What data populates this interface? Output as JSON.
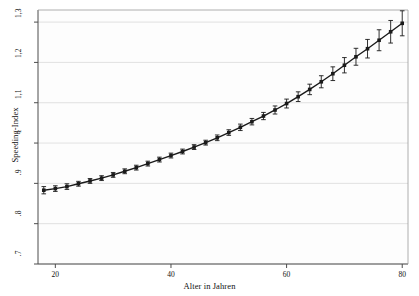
{
  "chart_data": {
    "type": "line",
    "title": "",
    "subtitle": "",
    "xlabel": "Alter in Jahren",
    "ylabel": "Speeding-Index",
    "xlim": [
      17,
      81
    ],
    "ylim": [
      0.7,
      1.33
    ],
    "xticks": [
      20,
      40,
      60,
      80
    ],
    "xticklabels": [
      "20",
      "40",
      "60",
      "80"
    ],
    "yticks": [
      0.7,
      0.8,
      0.9,
      1.0,
      1.1,
      1.2,
      1.3
    ],
    "yticklabels": [
      ".7",
      ".8",
      ".9",
      "1",
      "1,1",
      "1,2",
      "1,3"
    ],
    "grid": "horizontal",
    "legend": "none",
    "marker": "filled-square",
    "errorbars": true,
    "series": [
      {
        "name": "Speeding-Index",
        "color": "#1a1a1a",
        "x": [
          18,
          20,
          22,
          24,
          26,
          28,
          30,
          32,
          34,
          36,
          38,
          40,
          42,
          44,
          46,
          48,
          50,
          52,
          54,
          56,
          58,
          60,
          62,
          64,
          66,
          68,
          70,
          72,
          74,
          76,
          78,
          80
        ],
        "values": [
          0.883,
          0.887,
          0.892,
          0.899,
          0.906,
          0.913,
          0.921,
          0.93,
          0.939,
          0.949,
          0.959,
          0.969,
          0.979,
          0.99,
          1.001,
          1.013,
          1.026,
          1.039,
          1.053,
          1.067,
          1.082,
          1.098,
          1.115,
          1.133,
          1.152,
          1.172,
          1.193,
          1.214,
          1.234,
          1.255,
          1.276,
          1.297
        ],
        "err_low": [
          0.874,
          0.88,
          0.885,
          0.893,
          0.9,
          0.907,
          0.915,
          0.924,
          0.933,
          0.943,
          0.953,
          0.963,
          0.973,
          0.984,
          0.995,
          1.006,
          1.019,
          1.031,
          1.045,
          1.058,
          1.072,
          1.087,
          1.103,
          1.12,
          1.137,
          1.155,
          1.174,
          1.193,
          1.211,
          1.229,
          1.248,
          1.266
        ],
        "err_high": [
          0.892,
          0.894,
          0.899,
          0.905,
          0.912,
          0.919,
          0.927,
          0.936,
          0.945,
          0.955,
          0.965,
          0.975,
          0.985,
          0.996,
          1.007,
          1.02,
          1.033,
          1.047,
          1.061,
          1.076,
          1.092,
          1.109,
          1.127,
          1.146,
          1.167,
          1.189,
          1.212,
          1.235,
          1.257,
          1.281,
          1.304,
          1.328
        ]
      }
    ]
  },
  "axes": {
    "x_title": "Alter in Jahren",
    "y_title": "Speeding-Index"
  },
  "style": {
    "background": "#ffffff",
    "plot_background": "#fdfdfd",
    "grid_color": "#d9d9d9",
    "axis_color": "#4d4d4d",
    "series_color": "#1a1a1a"
  }
}
